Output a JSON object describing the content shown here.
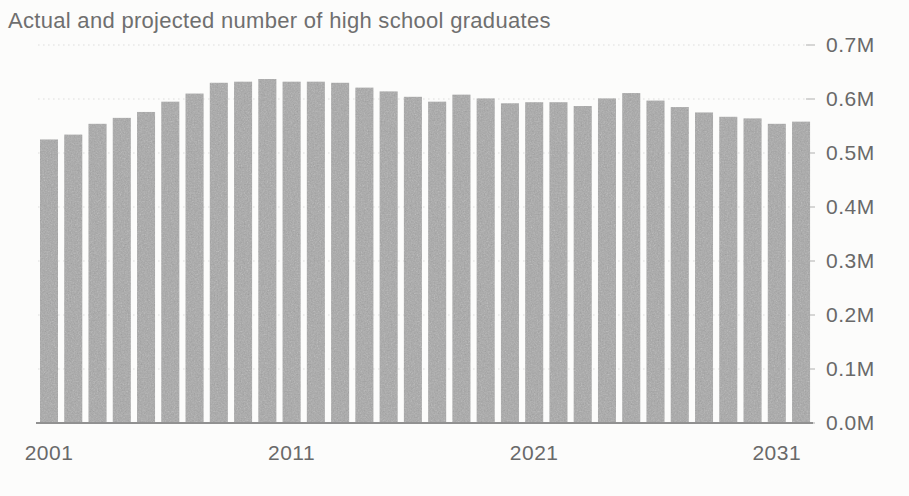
{
  "chart": {
    "title": "Actual and projected number of high school graduates"
  },
  "chart_data": {
    "type": "bar",
    "title": "Actual and projected number of high school graduates",
    "categories": [
      2001,
      2002,
      2003,
      2004,
      2005,
      2006,
      2007,
      2008,
      2009,
      2010,
      2011,
      2012,
      2013,
      2014,
      2015,
      2016,
      2017,
      2018,
      2019,
      2020,
      2021,
      2022,
      2023,
      2024,
      2025,
      2026,
      2027,
      2028,
      2029,
      2030,
      2031,
      2032
    ],
    "values": [
      0.525,
      0.534,
      0.554,
      0.565,
      0.576,
      0.595,
      0.61,
      0.63,
      0.632,
      0.637,
      0.632,
      0.632,
      0.63,
      0.621,
      0.614,
      0.604,
      0.595,
      0.608,
      0.601,
      0.592,
      0.594,
      0.594,
      0.587,
      0.601,
      0.611,
      0.597,
      0.585,
      0.575,
      0.567,
      0.564,
      0.554,
      0.558
    ],
    "values_unit": "M",
    "xlabel": "",
    "ylabel": "",
    "ylim": [
      0.0,
      0.7
    ],
    "y_tick_labels": [
      "0.7M",
      "0.6M",
      "0.5M",
      "0.4M",
      "0.3M",
      "0.2M",
      "0.1M",
      "0.0M"
    ],
    "x_tick_labels": [
      "2001",
      "2011",
      "2021",
      "2031"
    ],
    "x_tick_start_year": 2001,
    "y_axis_side": "right",
    "grid": "horizontal-dotted",
    "legend": "none",
    "colors": {
      "bar": "#a8a8a8",
      "gridline": "#dedede",
      "axis_line": "#919191",
      "tick_mark": "#cccccc",
      "title_text": "#6f6f6f",
      "axis_text": "#696969",
      "background": "#fcfcfb"
    }
  }
}
